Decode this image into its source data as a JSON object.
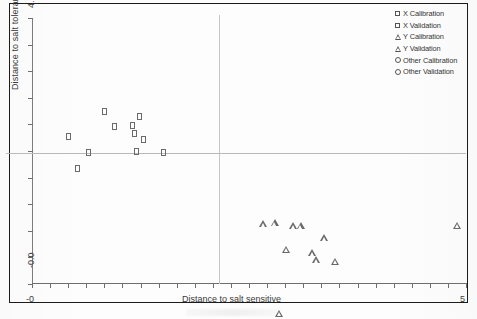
{
  "figure": {
    "background_color": "#fdfdfd",
    "frame_color": "#1c1c1c",
    "marker_color": "#6a6a6a",
    "gridline_color": "#c0c0c0"
  },
  "legend": {
    "position": "top-right",
    "entries": [
      {
        "label": "X Calibration",
        "symbol": "square",
        "icon": "square-marker-icon"
      },
      {
        "label": "X Validation",
        "symbol": "square",
        "icon": "square-marker-icon"
      },
      {
        "label": "Y Calibration",
        "symbol": "triangle",
        "icon": "triangle-marker-icon"
      },
      {
        "label": "Y Validation",
        "symbol": "triangle",
        "icon": "triangle-marker-icon"
      },
      {
        "label": "Other Calibration",
        "symbol": "circle",
        "icon": "circle-marker-icon"
      },
      {
        "label": "Other Validation",
        "symbol": "circle",
        "icon": "circle-marker-icon"
      }
    ]
  },
  "chart_data": {
    "type": "scatter",
    "title": "",
    "xlabel": "Distance to salt sensitive",
    "ylabel": "Distance to salt tolerant",
    "xlim": [
      0,
      5
    ],
    "ylim": [
      0,
      4.1
    ],
    "xticklabels": [
      "-0",
      "5"
    ],
    "yticklabels": [
      "-0.0",
      "4.1"
    ],
    "grid": false,
    "reference_lines": {
      "vertical_x": 2.15,
      "horizontal_y": 2.02
    },
    "series": [
      {
        "name": "X Calibration",
        "symbol": "square",
        "points": [
          [
            0.42,
            2.28
          ],
          [
            0.52,
            1.78
          ],
          [
            0.65,
            2.02
          ],
          [
            0.83,
            2.66
          ],
          [
            0.95,
            2.43
          ],
          [
            1.16,
            2.45
          ],
          [
            1.18,
            2.32
          ],
          [
            1.2,
            2.04
          ],
          [
            1.24,
            2.58
          ],
          [
            1.28,
            2.22
          ],
          [
            1.52,
            2.02
          ]
        ]
      },
      {
        "name": "Y Calibration",
        "symbol": "triangle",
        "points": [
          [
            2.62,
            0.93
          ],
          [
            2.75,
            1.05
          ],
          [
            2.88,
            0.75
          ],
          [
            2.96,
            1.22
          ],
          [
            3.05,
            1.33
          ],
          [
            3.18,
            1.02
          ],
          [
            3.23,
            1.02
          ],
          [
            3.32,
            1.47
          ],
          [
            3.45,
            1.21
          ],
          [
            2.8,
            0.52
          ],
          [
            4.85,
            1.98
          ]
        ]
      }
    ]
  }
}
